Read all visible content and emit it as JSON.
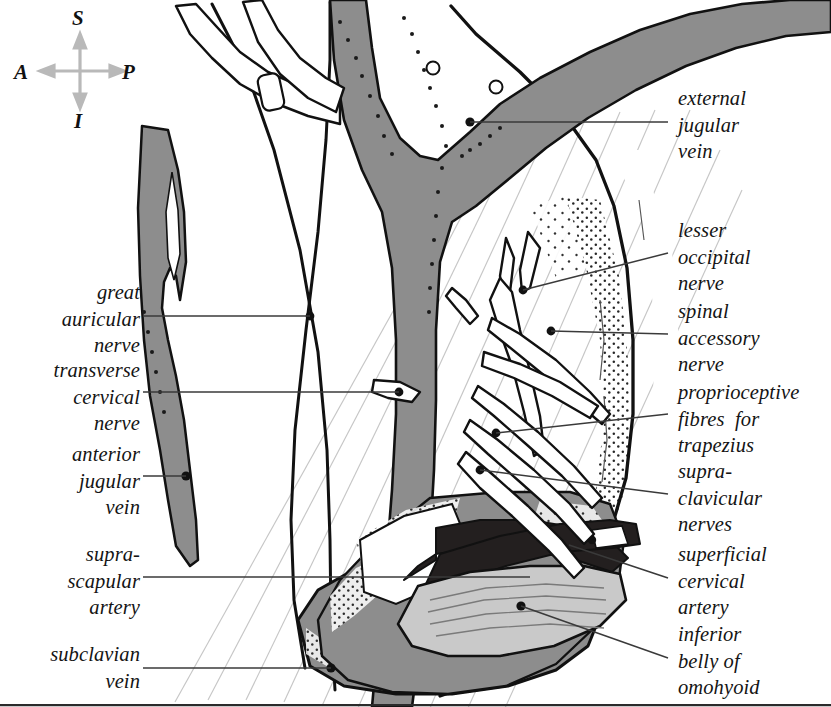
{
  "figure": {
    "type": "anatomical-illustration",
    "width": 831,
    "height": 707
  },
  "compass": {
    "name": "orientation-compass",
    "superior": "S",
    "anterior": "A",
    "posterior": "P",
    "inferior": "I",
    "arrow_color": "#b9b9b9"
  },
  "colors": {
    "background": "#ffffff",
    "outline": "#111111",
    "vein_gray": "#8d8d8d",
    "artery_dark": "#231f1f",
    "muscle_light": "#c9c9c9",
    "hatching": "#c8c8c8",
    "leader": "#3a3a3a",
    "stipple": "#1a1a1a"
  },
  "labels_left": [
    {
      "name": "label-great-auricular-nerve",
      "lines": [
        "great",
        "auricular",
        "nerve"
      ],
      "text": "great auricular nerve",
      "x": 4,
      "y": 279,
      "width": 136,
      "leader": {
        "x1": 143,
        "y1": 316,
        "x2": 310,
        "y2": 316
      }
    },
    {
      "name": "label-transverse-cervical-nerve",
      "lines": [
        "transverse",
        "cervical",
        "nerve"
      ],
      "text": "transverse cervical nerve",
      "x": 4,
      "y": 357,
      "width": 136,
      "leader": {
        "x1": 143,
        "y1": 392,
        "x2": 399,
        "y2": 392
      }
    },
    {
      "name": "label-anterior-jugular-vein",
      "lines": [
        "anterior",
        "jugular",
        "vein"
      ],
      "text": "anterior jugular vein",
      "x": 4,
      "y": 441,
      "width": 136,
      "leader": {
        "x1": 143,
        "y1": 476,
        "x2": 186,
        "y2": 476
      }
    },
    {
      "name": "label-suprascapular-artery",
      "lines": [
        "supra-",
        "scapular",
        "artery"
      ],
      "text": "suprascapular artery",
      "x": 4,
      "y": 541,
      "width": 136,
      "leader": {
        "x1": 143,
        "y1": 577,
        "x2": 530,
        "y2": 577
      }
    },
    {
      "name": "label-subclavian-vein",
      "lines": [
        "subclavian",
        "vein"
      ],
      "text": "subclavian vein",
      "x": 4,
      "y": 641,
      "width": 136,
      "leader": {
        "x1": 143,
        "y1": 668,
        "x2": 331,
        "y2": 668
      }
    }
  ],
  "labels_right": [
    {
      "name": "label-external-jugular-vein",
      "lines": [
        "external",
        "jugular",
        "vein"
      ],
      "text": "external jugular vein",
      "x": 678,
      "y": 85,
      "leader": {
        "x1": 668,
        "y1": 122,
        "x2": 470,
        "y2": 122
      }
    },
    {
      "name": "label-lesser-occipital-nerve",
      "lines": [
        "lesser",
        "occipital",
        "nerve"
      ],
      "text": "lesser occipital nerve",
      "x": 678,
      "y": 217,
      "leader": {
        "x1": 668,
        "y1": 253,
        "x2": 523,
        "y2": 290
      }
    },
    {
      "name": "label-spinal-accessory-nerve",
      "lines": [
        "spinal",
        "accessory",
        "nerve"
      ],
      "text": "spinal accessory nerve",
      "x": 678,
      "y": 298,
      "leader": {
        "x1": 668,
        "y1": 334,
        "x2": 551,
        "y2": 331
      }
    },
    {
      "name": "label-proprioceptive-fibres-for-trapezius",
      "lines": [
        "proprioceptive",
        "fibres  for",
        "trapezius"
      ],
      "text": "proprioceptive fibres for trapezius",
      "x": 678,
      "y": 379,
      "leader": {
        "x1": 668,
        "y1": 414,
        "x2": 496,
        "y2": 433
      }
    },
    {
      "name": "label-supraclavicular-nerves",
      "lines": [
        "supra-",
        "clavicular",
        "nerves"
      ],
      "text": "supraclavicular nerves",
      "x": 678,
      "y": 458,
      "leader": {
        "x1": 668,
        "y1": 494,
        "x2": 480,
        "y2": 470
      }
    },
    {
      "name": "label-superficial-cervical-artery",
      "lines": [
        "superficial",
        "cervical",
        "artery"
      ],
      "text": "superficial cervical artery",
      "x": 678,
      "y": 541,
      "leader": {
        "x1": 668,
        "y1": 578,
        "x2": 569,
        "y2": 545
      }
    },
    {
      "name": "label-inferior-belly-of-omohyoid",
      "lines": [
        "inferior",
        "belly of",
        "omohyoid"
      ],
      "text": "inferior belly of omohyoid",
      "x": 678,
      "y": 621,
      "leader": {
        "x1": 668,
        "y1": 658,
        "x2": 521,
        "y2": 606
      }
    }
  ],
  "structures": [
    {
      "name": "external-jugular-vein",
      "tone": "vein_gray"
    },
    {
      "name": "anterior-jugular-vein",
      "tone": "vein_gray"
    },
    {
      "name": "subclavian-vein",
      "tone": "vein_gray"
    },
    {
      "name": "suprascapular-artery",
      "tone": "artery_dark"
    },
    {
      "name": "superficial-cervical-artery",
      "tone": "artery_dark"
    },
    {
      "name": "inferior-belly-of-omohyoid",
      "tone": "muscle_light"
    },
    {
      "name": "sternocleidomastoid-border",
      "tone": "outline"
    },
    {
      "name": "trapezius-border",
      "tone": "outline"
    },
    {
      "name": "cervical-plexus-nerves",
      "tone": "outline"
    },
    {
      "name": "platysma-hatching",
      "tone": "hatching"
    },
    {
      "name": "fat-stipple",
      "tone": "stipple"
    }
  ]
}
